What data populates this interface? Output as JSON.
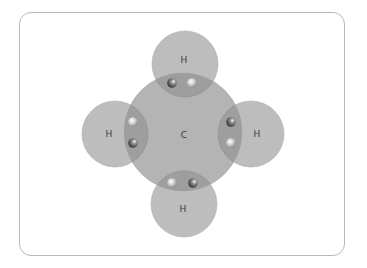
{
  "diagram": {
    "type": "electron-dot covalent bonding (methane CH4)",
    "center_atom": {
      "label": "C"
    },
    "outer_atoms": [
      {
        "position": "top",
        "label": "H"
      },
      {
        "position": "left",
        "label": "H"
      },
      {
        "position": "right",
        "label": "H"
      },
      {
        "position": "bottom",
        "label": "H"
      }
    ],
    "shared_electron_pairs": 4,
    "electrons_per_bond": 2,
    "colors": {
      "atom_fill": "#b9b9b9",
      "carbon_fill": "#b3b3b3",
      "overlap_fill": "#9d9d9d",
      "frame_border": "#b8b8b8"
    }
  }
}
